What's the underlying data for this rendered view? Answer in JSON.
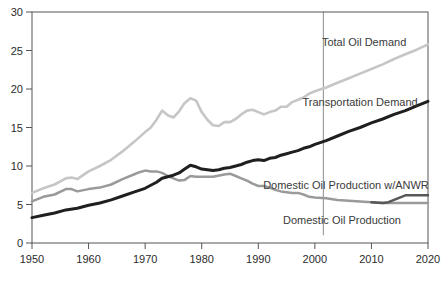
{
  "colors": {
    "background": "#ffffff",
    "axis": "#555555",
    "divider": "#8c8c8c",
    "tick_label": "#2b2b2b",
    "annotation_text": "#3a3a3a"
  },
  "chart_data": {
    "type": "line",
    "title": "",
    "xlabel": "",
    "ylabel": "",
    "xlim": [
      1950,
      2020
    ],
    "ylim": [
      0,
      30
    ],
    "x_ticks": [
      1950,
      1960,
      1970,
      1980,
      1990,
      2000,
      2010,
      2020
    ],
    "y_ticks": [
      0,
      5,
      10,
      15,
      20,
      25,
      30
    ],
    "grid": false,
    "legend_position": "in-plot-labels",
    "divider_x": 2001.5,
    "divider_y_span": [
      1.0,
      30
    ],
    "series": [
      {
        "name": "Total Oil Demand",
        "color": "#c6c6c6",
        "width": 2.6,
        "x": [
          1950,
          1952,
          1954,
          1956,
          1957,
          1958,
          1960,
          1962,
          1964,
          1966,
          1968,
          1970,
          1971,
          1972,
          1973,
          1974,
          1975,
          1976,
          1977,
          1978,
          1979,
          1980,
          1981,
          1982,
          1983,
          1984,
          1985,
          1986,
          1987,
          1988,
          1989,
          1990,
          1991,
          1992,
          1993,
          1994,
          1995,
          1996,
          1997,
          1998,
          1999,
          2000,
          2002,
          2004,
          2006,
          2008,
          2010,
          2012,
          2014,
          2016,
          2018,
          2020
        ],
        "y": [
          6.5,
          7.1,
          7.6,
          8.4,
          8.5,
          8.3,
          9.3,
          10.0,
          10.8,
          11.9,
          13.1,
          14.4,
          15.0,
          16.0,
          17.2,
          16.6,
          16.3,
          17.1,
          18.2,
          18.8,
          18.5,
          17.0,
          16.0,
          15.3,
          15.2,
          15.7,
          15.7,
          16.1,
          16.7,
          17.2,
          17.3,
          17.0,
          16.7,
          17.0,
          17.2,
          17.7,
          17.7,
          18.3,
          18.6,
          18.9,
          19.4,
          19.7,
          20.2,
          20.8,
          21.4,
          22.0,
          22.6,
          23.2,
          23.9,
          24.5,
          25.1,
          25.8
        ]
      },
      {
        "name": "Domestic Oil Production",
        "color": "#9a9a9a",
        "width": 2.5,
        "x": [
          1950,
          1952,
          1954,
          1956,
          1957,
          1958,
          1960,
          1962,
          1964,
          1966,
          1968,
          1969,
          1970,
          1971,
          1972,
          1973,
          1974,
          1975,
          1976,
          1977,
          1978,
          1979,
          1980,
          1982,
          1984,
          1985,
          1986,
          1987,
          1988,
          1989,
          1990,
          1991,
          1992,
          1993,
          1994,
          1995,
          1996,
          1997,
          1998,
          1999,
          2000,
          2002,
          2004,
          2006,
          2008,
          2010,
          2012,
          2014,
          2016,
          2018,
          2020
        ],
        "y": [
          5.4,
          6.0,
          6.3,
          7.0,
          7.0,
          6.7,
          7.0,
          7.2,
          7.6,
          8.3,
          8.9,
          9.2,
          9.4,
          9.3,
          9.3,
          9.1,
          8.7,
          8.4,
          8.1,
          8.2,
          8.7,
          8.6,
          8.6,
          8.6,
          8.9,
          9.0,
          8.7,
          8.4,
          8.1,
          7.7,
          7.4,
          7.4,
          7.2,
          6.9,
          6.7,
          6.6,
          6.5,
          6.5,
          6.3,
          6.0,
          5.9,
          5.8,
          5.6,
          5.5,
          5.4,
          5.3,
          5.2,
          5.2,
          5.2,
          5.2,
          5.2
        ]
      },
      {
        "name": "Domestic Oil Production w/ANWR",
        "color": "#585858",
        "width": 2.5,
        "x": [
          2010,
          2012,
          2013,
          2014,
          2015,
          2016,
          2018,
          2020
        ],
        "y": [
          5.3,
          5.2,
          5.3,
          5.6,
          5.9,
          6.2,
          6.2,
          6.2
        ]
      },
      {
        "name": "Transportation Demand",
        "color": "#1f1f1f",
        "width": 3.0,
        "x": [
          1950,
          1952,
          1954,
          1956,
          1958,
          1960,
          1962,
          1964,
          1966,
          1968,
          1970,
          1972,
          1973,
          1974,
          1975,
          1976,
          1977,
          1978,
          1979,
          1980,
          1981,
          1982,
          1983,
          1984,
          1985,
          1986,
          1987,
          1988,
          1989,
          1990,
          1991,
          1992,
          1993,
          1994,
          1995,
          1996,
          1997,
          1998,
          1999,
          2000,
          2002,
          2004,
          2006,
          2008,
          2010,
          2012,
          2014,
          2016,
          2018,
          2020
        ],
        "y": [
          3.3,
          3.6,
          3.9,
          4.3,
          4.5,
          4.9,
          5.2,
          5.6,
          6.1,
          6.6,
          7.1,
          7.9,
          8.4,
          8.6,
          8.8,
          9.1,
          9.6,
          10.1,
          9.9,
          9.6,
          9.5,
          9.4,
          9.5,
          9.7,
          9.8,
          10.0,
          10.2,
          10.5,
          10.7,
          10.8,
          10.7,
          11.0,
          11.1,
          11.4,
          11.6,
          11.8,
          12.0,
          12.3,
          12.5,
          12.8,
          13.3,
          13.9,
          14.5,
          15.0,
          15.6,
          16.1,
          16.7,
          17.2,
          17.8,
          18.4
        ]
      }
    ],
    "annotations": [
      {
        "text": "Total Oil Demand",
        "x": 2008.7,
        "y": 26.1,
        "font_size": 11
      },
      {
        "text": "Transportation Demand",
        "x": 2008.0,
        "y": 18.3,
        "font_size": 11
      },
      {
        "text": "Domestic Oil Production w/ANWR",
        "x": 2005.5,
        "y": 7.5,
        "font_size": 11
      },
      {
        "text": "Domestic Oil Production",
        "x": 2004.8,
        "y": 3.0,
        "font_size": 11
      }
    ],
    "tick_font_size": 11
  }
}
